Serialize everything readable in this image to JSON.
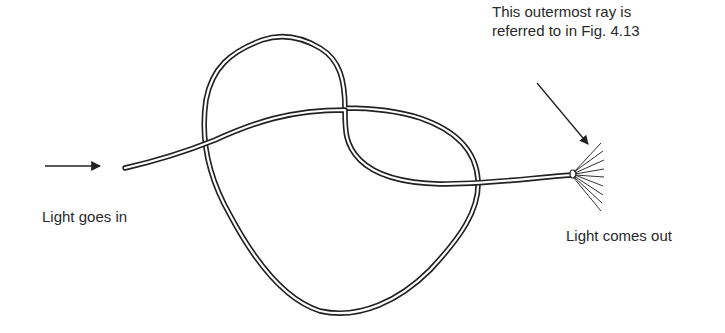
{
  "figure": {
    "labels": {
      "input": "Light goes in",
      "output": "Light comes out",
      "note_line1": "This outermost ray is",
      "note_line2": "referred to in Fig. 4.13"
    },
    "elements": {
      "input_arrow": "arrow-right-icon",
      "fiber": "optical-fiber-loop",
      "output_rays": "light-ray-fan",
      "pointer_arrow": "arrow-diagonal-icon"
    },
    "colors": {
      "stroke": "#222222",
      "background": "#ffffff"
    }
  }
}
